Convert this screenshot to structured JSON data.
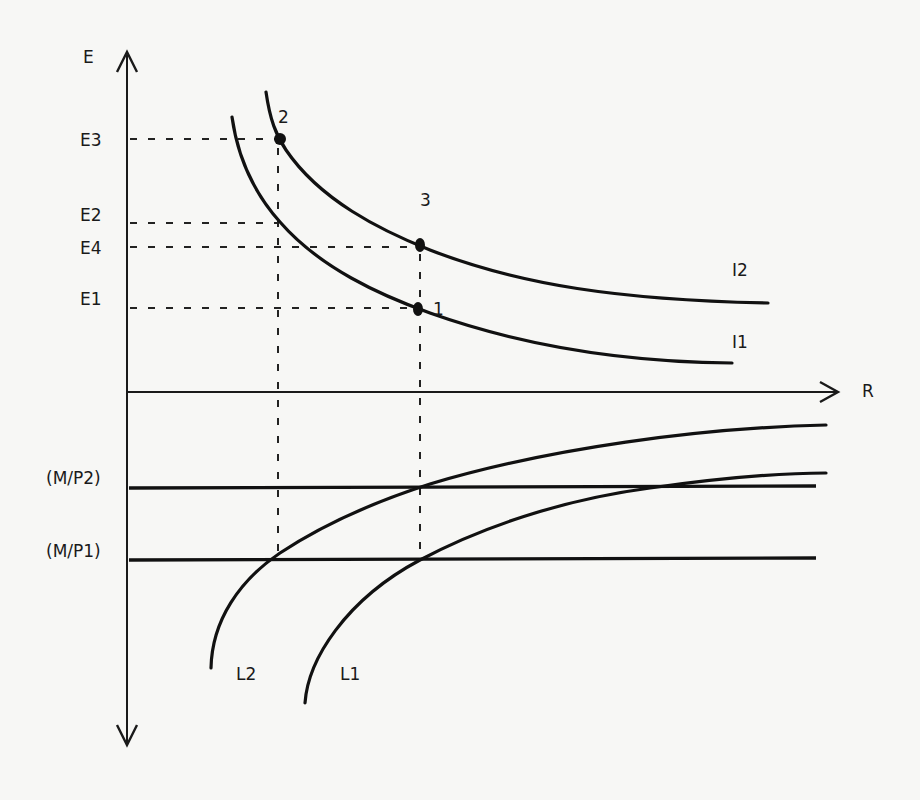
{
  "diagram": {
    "type": "economics two-panel diagram (indifference curves above, liquidity curves below)",
    "axes": {
      "vertical_label": "E",
      "horizontal_label": "R"
    },
    "y_axis_levels": [
      {
        "label": "E3",
        "y": 139
      },
      {
        "label": "E2",
        "y": 223
      },
      {
        "label": "E4",
        "y": 247
      },
      {
        "label": "E1",
        "y": 308
      }
    ],
    "upper_curves": [
      {
        "label": "I2",
        "description": "upper indifference curve"
      },
      {
        "label": "I1",
        "description": "lower indifference curve"
      }
    ],
    "points": [
      {
        "label": "2",
        "on": "I2",
        "level": "E3"
      },
      {
        "label": "3",
        "on": "I2",
        "level": "E4"
      },
      {
        "label": "1",
        "on": "I1",
        "level": "E1"
      }
    ],
    "lower_levels": [
      {
        "label": "(M/P2)",
        "y": 488
      },
      {
        "label": "(M/P1)",
        "y": 560
      }
    ],
    "lower_curves": [
      {
        "label": "L2",
        "description": "left concave curve"
      },
      {
        "label": "L1",
        "description": "right concave curve"
      }
    ]
  },
  "labels": {
    "E": "E",
    "R": "R",
    "E3": "E3",
    "E2": "E2",
    "E4": "E4",
    "E1": "E1",
    "I2": "I2",
    "I1": "I1",
    "p1": "1",
    "p2": "2",
    "p3": "3",
    "MP2": "(M/P2)",
    "MP1": "(M/P1)",
    "L2": "L2",
    "L1": "L1"
  }
}
